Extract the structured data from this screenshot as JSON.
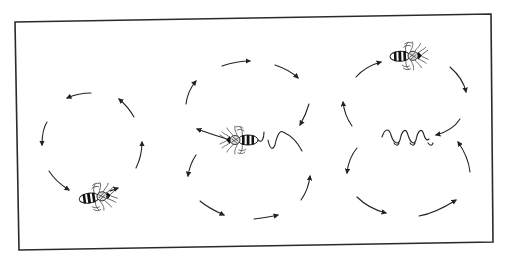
{
  "figure": {
    "type": "line-illustration",
    "background": "#ffffff",
    "ink_color": "#222222",
    "panels": [
      {
        "id": "left",
        "pattern": "circular-dance",
        "bee_position": "bottom",
        "arrow_count": 6
      },
      {
        "id": "middle",
        "pattern": "waggle-dance-loop",
        "bee_position": "center",
        "arrow_count": 9
      },
      {
        "id": "right",
        "pattern": "figure-eight-waggle",
        "bee_position": "top",
        "arrow_count": 7
      }
    ]
  },
  "icons": {
    "bee": "bee-icon",
    "arrow": "arrow-icon",
    "waggle": "waggle-path-icon"
  }
}
